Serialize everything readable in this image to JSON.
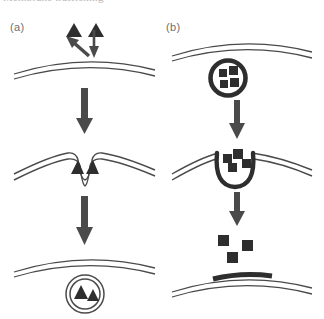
{
  "figure": {
    "cropped_caption_top": "Membrane trafficking",
    "panels": [
      {
        "id": "a",
        "label": "(a)",
        "process": "endocytosis",
        "stages": [
          {
            "stage": 1,
            "description": "Triangular cargo particles approach the outer face of a flat plasma membrane; one arrow points away up-left, one arrow points down toward the membrane",
            "cargo_shape": "triangle",
            "cargo_count": 2,
            "membrane_style": "double-line-thin-curve",
            "small_arrows": 2
          },
          {
            "stage": 2,
            "description": "Membrane invaginates forming a coated pit enclosing the two triangular particles",
            "cargo_shape": "triangle",
            "cargo_count": 2,
            "membrane_style": "double-line-thin-curve-with-pit"
          },
          {
            "stage": 3,
            "description": "Pit pinches off into a free double-membrane vesicle containing the two triangular particles, below the intact membrane",
            "cargo_shape": "triangle",
            "cargo_count": 2,
            "membrane_style": "double-line-thin-curve",
            "vesicle": "double-ring-circle"
          }
        ],
        "step_arrows": 2
      },
      {
        "id": "b",
        "label": "(b)",
        "process": "exocytosis",
        "stages": [
          {
            "stage": 1,
            "description": "Thick-walled secretory vesicle loaded with square cargo particles sits beneath the plasma membrane",
            "cargo_shape": "square",
            "cargo_count": 4,
            "membrane_style": "double-line-thin-curve",
            "vesicle": "thick-ring-circle"
          },
          {
            "stage": 2,
            "description": "Vesicle docks and fuses with the membrane, forming a thick-walled open pocket releasing the square cargo",
            "cargo_shape": "square",
            "cargo_count": 4,
            "membrane_style": "double-line-thin-curve-with-thick-fused-pit"
          },
          {
            "stage": 3,
            "description": "Square cargo particles are released outside; the vesicle membrane is now incorporated as a thick dark patch in the plasma membrane",
            "cargo_shape": "square",
            "cargo_count": 3,
            "membrane_style": "double-line-thin-curve-with-thick-dark-patch"
          }
        ],
        "step_arrows": 2
      }
    ],
    "colors": {
      "ink": "#3a3a3a",
      "cargo_fill": "#2e2e2e",
      "membrane_line": "#4a4a4a",
      "thick_membrane": "#3a3a3a",
      "arrow": "#4a4a4a",
      "label_text": "#6e6e6e",
      "background": "#ffffff"
    }
  }
}
